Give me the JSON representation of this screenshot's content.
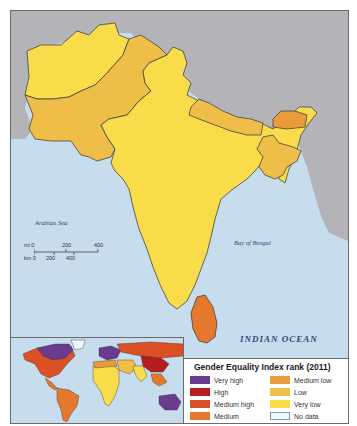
{
  "map": {
    "title": "Gender Equality Index rank (2011)",
    "labels": {
      "arabian_sea": "Arabian Sea",
      "bay_of_bengal": "Bay of Bengal",
      "indian_ocean": "INDIAN OCEAN"
    },
    "scale": {
      "mi_label": "mi 0",
      "mi_ticks": [
        "200",
        "400"
      ],
      "km_label": "km 0",
      "km_ticks": [
        "200",
        "400"
      ]
    },
    "colors": {
      "ocean": "#c7dcec",
      "land_other": "#b4b4b8",
      "very_low": "#f8dc4a",
      "low": "#efbe48",
      "medium_low": "#e99a3a",
      "medium": "#e4782e",
      "medium_high": "#dd4f24",
      "high": "#b81c1c",
      "very_high": "#6a3a8e",
      "no_data": "#eef7fb"
    },
    "regions": [
      {
        "name": "Afghanistan",
        "category": "Very low"
      },
      {
        "name": "Pakistan",
        "category": "Low"
      },
      {
        "name": "India",
        "category": "Very low"
      },
      {
        "name": "Nepal",
        "category": "Low"
      },
      {
        "name": "Bhutan",
        "category": "Medium low"
      },
      {
        "name": "Bangladesh",
        "category": "Low"
      },
      {
        "name": "Sri Lanka",
        "category": "Medium"
      }
    ]
  },
  "legend": {
    "title": "Gender Equality Index rank (2011)",
    "items": [
      {
        "label": "Very high",
        "color": "#6a3a8e"
      },
      {
        "label": "Medium low",
        "color": "#e99a3a"
      },
      {
        "label": "High",
        "color": "#b81c1c"
      },
      {
        "label": "Low",
        "color": "#efbe48"
      },
      {
        "label": "Medium high",
        "color": "#dd4f24"
      },
      {
        "label": "Very low",
        "color": "#f8dc4a"
      },
      {
        "label": "Medium",
        "color": "#e4782e"
      },
      {
        "label": "No data",
        "color": "#eef7fb"
      }
    ]
  }
}
